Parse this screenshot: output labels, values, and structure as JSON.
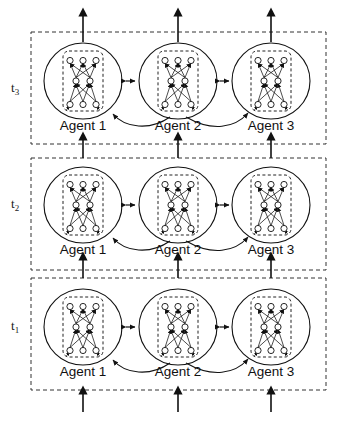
{
  "figure": {
    "background_color": "#ffffff",
    "line_color": "#111111",
    "dash_color": "#333333"
  },
  "timesteps": [
    {
      "id": "t3",
      "label": "t",
      "subscript": "3",
      "y": 32,
      "height": 112
    },
    {
      "id": "t2",
      "label": "t",
      "subscript": "2",
      "y": 158,
      "height": 112
    },
    {
      "id": "t1",
      "label": "t",
      "subscript": "1",
      "y": 278,
      "height": 112
    }
  ],
  "agents": [
    {
      "id": "agent1",
      "label": "Agent 1",
      "cx": 83
    },
    {
      "id": "agent2",
      "label": "Agent 2",
      "cx": 178
    },
    {
      "id": "agent3",
      "label": "Agent 3",
      "cx": 271
    }
  ],
  "network": {
    "description": "fully-connected feedforward module",
    "layers": [
      {
        "name": "output-layer",
        "nodes": 3
      },
      {
        "name": "hidden-layer",
        "nodes": 2
      },
      {
        "name": "input-layer",
        "nodes": 3
      }
    ],
    "flow": "bottom-to-top"
  },
  "connections": {
    "bidirectional_label": "agent-to-agent bidirectional link",
    "curved_label": "agent 2 broadcast to agent 1 and agent 3",
    "vertical_label": "temporal recurrent connection"
  },
  "caption": ""
}
